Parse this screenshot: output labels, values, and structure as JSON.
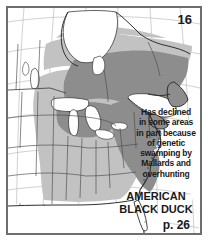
{
  "plate": {
    "number": "16"
  },
  "note": {
    "lines": [
      "Has declined",
      "in some areas",
      "in part because",
      "of genetic",
      "swamping by",
      "Mallards and",
      "overhunting"
    ],
    "full_text": "Has declined in some areas in part because of genetic swamping by Mallards and overhunting"
  },
  "species": {
    "name_lines": [
      "AMERICAN",
      "BLACK DUCK"
    ],
    "common_name": "AMERICAN BLACK DUCK"
  },
  "page_reference": {
    "label": "p. 26"
  },
  "colors": {
    "frame_border": "#6e6e6e",
    "page_background": "#ffffff",
    "land_outline": "#3a3a3a",
    "graticule": "#b9b9b9",
    "water": "#ffffff",
    "winter_range_light_gray": "#c2c2c2",
    "breeding_range_dark_gray": "#8d8d8d",
    "text": "#1a1a1a"
  },
  "map": {
    "projection_hint": "conic, North America east of Rockies",
    "legend_implied": [
      {
        "swatch": "#8d8d8d",
        "meaning": "breeding / core range"
      },
      {
        "swatch": "#c2c2c2",
        "meaning": "winter / secondary range"
      },
      {
        "swatch": "#ffffff",
        "meaning": "outside range / water"
      }
    ],
    "water_bodies": [
      "Hudson Bay",
      "James Bay",
      "Great Lakes",
      "Gulf of St. Lawrence",
      "Lake Winnipeg"
    ]
  }
}
